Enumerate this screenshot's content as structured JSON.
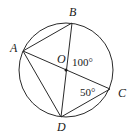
{
  "figure": {
    "circle": {
      "center": [
        66,
        70
      ],
      "radius": 47,
      "stroke": "#2a2a2a"
    },
    "points": {
      "A": {
        "x": 23,
        "y": 51,
        "label": "A",
        "label_pos": [
          14,
          52
        ]
      },
      "B": {
        "x": 72,
        "y": 23,
        "label": "B",
        "label_pos": [
          73,
          17
        ]
      },
      "C": {
        "x": 110,
        "y": 89,
        "label": "C",
        "label_pos": [
          122,
          97
        ]
      },
      "D": {
        "x": 61,
        "y": 117,
        "label": "D",
        "label_pos": [
          61,
          131
        ]
      },
      "O": {
        "x": 66,
        "y": 70,
        "label": "O",
        "label_pos": [
          61,
          63
        ]
      }
    },
    "segments": [
      "AB",
      "BD",
      "AC",
      "AD",
      "DC"
    ],
    "angle_labels": [
      {
        "text": "100°",
        "pos": [
          73,
          66
        ],
        "note": "angle BOC"
      },
      {
        "text": "50°",
        "pos": [
          81,
          96
        ],
        "note": "angle ACD"
      }
    ]
  }
}
